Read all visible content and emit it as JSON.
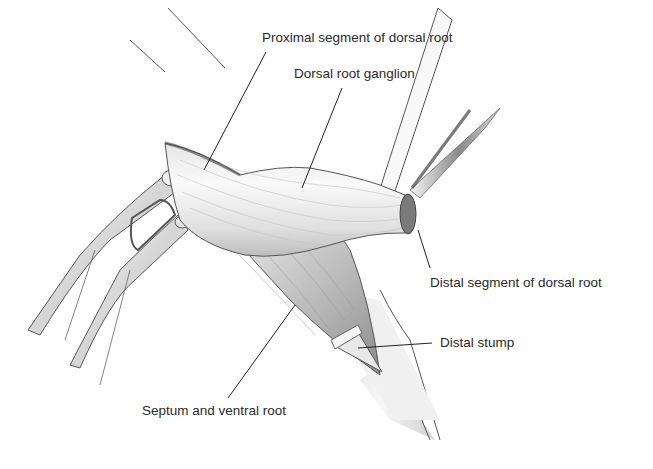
{
  "figure": {
    "labels": [
      {
        "id": "proximal",
        "text": "Proximal segment of dorsal root",
        "x": 262,
        "y": 31
      },
      {
        "id": "ganglion",
        "text": "Dorsal root ganglion",
        "x": 294,
        "y": 67
      },
      {
        "id": "distal_segment",
        "text": "Distal segment of dorsal root",
        "x": 430,
        "y": 276
      },
      {
        "id": "distal_stump",
        "text": "Distal stump",
        "x": 440,
        "y": 336
      },
      {
        "id": "septum",
        "text": "Septum and ventral root",
        "x": 142,
        "y": 404
      }
    ],
    "colors": {
      "background": "#ffffff",
      "line": "#2a2a2a",
      "tissue_light": "#f2f2f2",
      "tissue_mid": "#c8c8c8",
      "tissue_dark": "#8a8a8a"
    }
  }
}
